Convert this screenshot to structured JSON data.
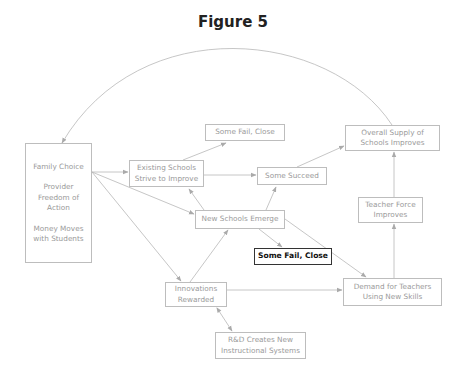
{
  "figure": {
    "title": "Figure 5"
  },
  "nodes": {
    "family": {
      "lines": [
        "Family Choice",
        "Provider",
        "Freedom of",
        "Action",
        "Money Moves",
        "with Students"
      ]
    },
    "existing": {
      "lines": [
        "Existing Schools",
        "Strive to Improve"
      ]
    },
    "fail_top": {
      "lines": [
        "Some Fail, Close"
      ]
    },
    "succeed": {
      "lines": [
        "Some Succeed"
      ]
    },
    "overall": {
      "lines": [
        "Overall Supply of",
        "Schools Improves"
      ]
    },
    "teacher": {
      "lines": [
        "Teacher Force",
        "Improves"
      ]
    },
    "new_schools": {
      "lines": [
        "New Schools Emerge"
      ]
    },
    "fail_bold": {
      "lines": [
        "Some Fail, Close"
      ]
    },
    "innovations": {
      "lines": [
        "Innovations",
        "Rewarded"
      ]
    },
    "demand": {
      "lines": [
        "Demand for Teachers",
        "Using New Skills"
      ]
    },
    "rnd": {
      "lines": [
        "R&D Creates New",
        "Instructional Systems"
      ]
    }
  },
  "edges": [
    {
      "from": "family",
      "to": "existing"
    },
    {
      "from": "family",
      "to": "new_schools"
    },
    {
      "from": "family",
      "to": "innovations"
    },
    {
      "from": "existing",
      "to": "fail_top"
    },
    {
      "from": "existing",
      "to": "succeed"
    },
    {
      "from": "new_schools",
      "to": "existing"
    },
    {
      "from": "new_schools",
      "to": "succeed"
    },
    {
      "from": "new_schools",
      "to": "fail_bold"
    },
    {
      "from": "new_schools",
      "to": "demand"
    },
    {
      "from": "succeed",
      "to": "overall"
    },
    {
      "from": "teacher",
      "to": "overall"
    },
    {
      "from": "demand",
      "to": "teacher"
    },
    {
      "from": "innovations",
      "to": "new_schools"
    },
    {
      "from": "innovations",
      "to": "demand"
    },
    {
      "from": "innovations",
      "to": "rnd",
      "bidirectional": true
    },
    {
      "from": "overall",
      "to": "family",
      "curved": true
    }
  ],
  "colors": {
    "line": "#b5b5b5",
    "box_border": "#bdbdbd",
    "text": "#9a9a9a",
    "highlight_border": "#333333"
  }
}
